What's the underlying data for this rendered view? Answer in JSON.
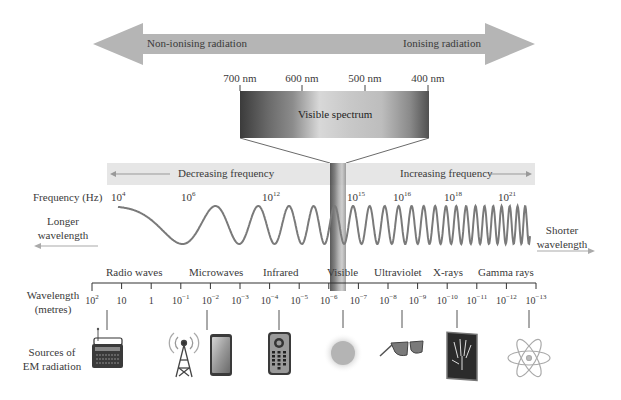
{
  "radiation_arrow": {
    "left_label": "Non-ionising radiation",
    "right_label": "Ionising radiation",
    "color": "#b3b3b3"
  },
  "visible_spectrum": {
    "title": "Visible spectrum",
    "ticks": [
      "700 nm",
      "600 nm",
      "500 nm",
      "400 nm"
    ]
  },
  "frequency_band": {
    "left_label": "Decreasing frequency",
    "right_label": "Increasing frequency",
    "color": "#e6e6e6"
  },
  "frequency_axis": {
    "label": "Frequency (Hz)",
    "ticks": [
      {
        "base": "10",
        "exp": "4"
      },
      {
        "base": "10",
        "exp": "6"
      },
      {
        "base": "10",
        "exp": "12"
      },
      {
        "base": "10",
        "exp": "15"
      },
      {
        "base": "10",
        "exp": "16"
      },
      {
        "base": "10",
        "exp": "18"
      },
      {
        "base": "10",
        "exp": "21"
      }
    ]
  },
  "wave": {
    "left_label_line1": "Longer",
    "left_label_line2": "wavelength",
    "right_label_line1": "Shorter",
    "right_label_line2": "wavelength",
    "color": "#7a7a7a"
  },
  "regions": [
    "Radio waves",
    "Microwaves",
    "Infrared",
    "Visible",
    "Ultraviolet",
    "X-rays",
    "Gamma rays"
  ],
  "wavelength_axis": {
    "label_line1": "Wavelength",
    "label_line2": "(metres)",
    "ticks": [
      {
        "base": "10",
        "exp": "2"
      },
      {
        "base": "10",
        "exp": ""
      },
      {
        "base": "1",
        "exp": ""
      },
      {
        "base": "10",
        "exp": "−1"
      },
      {
        "base": "10",
        "exp": "−2"
      },
      {
        "base": "10",
        "exp": "−3"
      },
      {
        "base": "10",
        "exp": "−4"
      },
      {
        "base": "10",
        "exp": "−5"
      },
      {
        "base": "10",
        "exp": "−6"
      },
      {
        "base": "10",
        "exp": "−7"
      },
      {
        "base": "10",
        "exp": "−8"
      },
      {
        "base": "10",
        "exp": "−9"
      },
      {
        "base": "10",
        "exp": "−10"
      },
      {
        "base": "10",
        "exp": "−11"
      },
      {
        "base": "10",
        "exp": "−12"
      },
      {
        "base": "10",
        "exp": "−13"
      }
    ]
  },
  "sources": {
    "label_line1": "Sources of",
    "label_line2": "EM radiation",
    "icons": [
      "radio-icon",
      "radio-tower-icon",
      "mobile-phone-icon",
      "remote-control-icon",
      "sun-icon",
      "sunglasses-icon",
      "x-ray-hand-icon",
      "atom-icon"
    ]
  }
}
